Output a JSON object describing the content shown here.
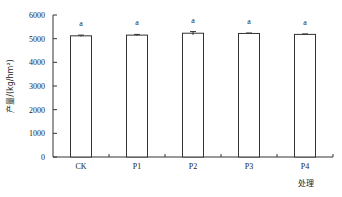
{
  "chart_data": {
    "type": "bar",
    "title": "",
    "xlabel": "处理",
    "ylabel": "产量/(kg/hm²)",
    "categories": [
      "CK",
      "P1",
      "P2",
      "P3",
      "P4"
    ],
    "values": [
      5120,
      5150,
      5230,
      5220,
      5180
    ],
    "errors": [
      60,
      60,
      140,
      40,
      40
    ],
    "significance": [
      "a",
      "a",
      "a",
      "a",
      "a"
    ],
    "ylim": [
      0,
      6000
    ],
    "yticks": [
      0,
      1000,
      2000,
      3000,
      4000,
      5000,
      6000
    ],
    "grid": false,
    "legend": null,
    "bar_fill": "#ffffff",
    "bar_stroke": "#333333"
  }
}
